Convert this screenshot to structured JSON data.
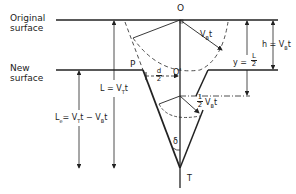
{
  "diagram": {
    "labels": {
      "original_surface_line1": "Original",
      "original_surface_line2": "surface",
      "new_surface_line1": "New",
      "new_surface_line2": "surface",
      "point_O": "O",
      "point_O_prime": "O'",
      "point_P": "P",
      "point_T": "T",
      "angle_delta": "δ",
      "vbt": "V",
      "vbt_sub": "B",
      "vbt_t": "t",
      "h_label": "h = V",
      "h_sub": "B",
      "h_t": "t",
      "y_label": "y =",
      "y_num": "L",
      "y_den": "2",
      "d_num": "d",
      "d_den": "2",
      "L_label": "L = V",
      "L_sub": "T",
      "L_t": "t",
      "Le_label": "L",
      "Le_sub": "e",
      "Le_rest": "= V",
      "Le_sub2": "T",
      "Le_rest2": "t − V",
      "Le_sub3": "B",
      "Le_t": "t",
      "half_num": "1",
      "half_den": "2",
      "half_vb": "V",
      "half_vb_sub": "B",
      "half_vb_t": "t"
    },
    "colors": {
      "line": "#222222",
      "background": "#ffffff"
    }
  }
}
